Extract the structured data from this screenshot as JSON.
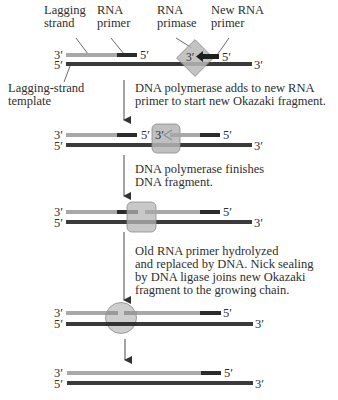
{
  "colors": {
    "dna_new_strand": "#a8a8a8",
    "rna_primer": "#2b2b2b",
    "template_strand": "#3a3a3a",
    "enzyme_fill": "#b5b5b5",
    "enzyme_stroke": "#8a8a8a",
    "arrow": "#333333"
  },
  "labels": {
    "lagging_strand": "Lagging\nstrand",
    "rna_primer": "RNA\nprimer",
    "rna_primase": "RNA\nprimase",
    "new_rna_primer": "New RNA\nprimer",
    "lagging_strand_template": "Lagging-strand\ntemplate"
  },
  "ends": {
    "three_prime": "3′",
    "five_prime": "5′"
  },
  "steps": [
    {
      "id": "step1",
      "caption": "DNA polymerase adds to new RNA\nprimer to start new Okazaki fragment."
    },
    {
      "id": "step2",
      "caption": "DNA polymerase finishes\nDNA fragment."
    },
    {
      "id": "step3",
      "caption": "Old RNA primer hydrolyzed\nand replaced by DNA. Nick sealing\nby DNA ligase joins new Okazaki\nfragment to the growing chain."
    }
  ],
  "stages": [
    {
      "name": "primase-synthesizes-primer",
      "enzyme": "RNA primase (diamond)"
    },
    {
      "name": "polymerase-extends-new-fragment",
      "enzyme": "DNA polymerase (rounded square)"
    },
    {
      "name": "polymerase-finishes-fragment",
      "enzyme": "DNA polymerase (rounded square)"
    },
    {
      "name": "primer-replaced-nick-sealing",
      "enzyme": "DNA ligase (circle)"
    },
    {
      "name": "joined-okazaki-fragment",
      "enzyme": "none"
    }
  ]
}
